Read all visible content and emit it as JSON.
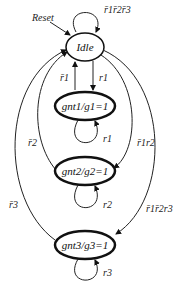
{
  "diagram": {
    "type": "state-machine",
    "reset_label": "Reset",
    "states": [
      {
        "id": "idle",
        "label": "Idle",
        "self_loop": "r̄1r̄2r̄3"
      },
      {
        "id": "gnt1",
        "label": "gnt1/g1=1",
        "self_loop": "r1"
      },
      {
        "id": "gnt2",
        "label": "gnt2/g2=1",
        "self_loop": "r2"
      },
      {
        "id": "gnt3",
        "label": "gnt3/g3=1",
        "self_loop": "r3"
      }
    ],
    "transitions": [
      {
        "from": "idle",
        "to": "gnt1",
        "label": "r1"
      },
      {
        "from": "gnt1",
        "to": "idle",
        "label": "r̄1"
      },
      {
        "from": "idle",
        "to": "gnt2",
        "label": "r̄1r2"
      },
      {
        "from": "gnt2",
        "to": "idle",
        "label": "r̄2"
      },
      {
        "from": "idle",
        "to": "gnt3",
        "label": "r̄1r̄2r3"
      },
      {
        "from": "gnt3",
        "to": "idle",
        "label": "r̄3"
      }
    ]
  }
}
